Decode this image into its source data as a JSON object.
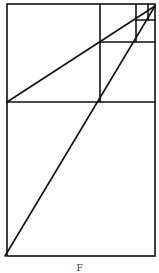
{
  "figure": {
    "stroke_color": "#111111",
    "stroke_width": 1.6,
    "outer_rect": {
      "x1": 7,
      "y1": 4,
      "x2": 155,
      "y2": 256
    },
    "lines": [
      {
        "id": "h1",
        "x1": 7,
        "y1": 102,
        "x2": 155,
        "y2": 102
      },
      {
        "id": "v1",
        "x1": 100,
        "y1": 4,
        "x2": 100,
        "y2": 102
      },
      {
        "id": "h2",
        "x1": 100,
        "y1": 42,
        "x2": 155,
        "y2": 42
      },
      {
        "id": "v2",
        "x1": 136,
        "y1": 4,
        "x2": 136,
        "y2": 42
      },
      {
        "id": "h3",
        "x1": 136,
        "y1": 20,
        "x2": 155,
        "y2": 20
      },
      {
        "id": "v3",
        "x1": 148,
        "y1": 4,
        "x2": 148,
        "y2": 20
      },
      {
        "id": "diag-upper",
        "x1": 7,
        "y1": 102,
        "x2": 155,
        "y2": 6
      },
      {
        "id": "diag-lower",
        "x1": 5,
        "y1": 256,
        "x2": 155,
        "y2": 6
      }
    ]
  },
  "caption": "F"
}
